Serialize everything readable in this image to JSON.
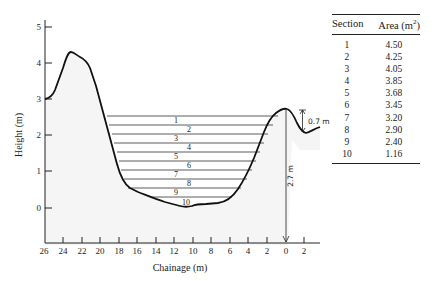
{
  "figure": {
    "y_axis": {
      "label": "Height (m)",
      "ticks": [
        "0",
        "1",
        "2",
        "3",
        "4",
        "5"
      ]
    },
    "x_axis": {
      "label": "Chainage (m)",
      "ticks": [
        "26",
        "24",
        "22",
        "20",
        "18",
        "16",
        "14",
        "12",
        "10",
        "8",
        "6",
        "4",
        "2",
        "0",
        "2"
      ]
    },
    "section_labels": [
      "1",
      "2",
      "3",
      "4",
      "5",
      "6",
      "7",
      "8",
      "9",
      "10"
    ],
    "annotations": {
      "vertical_depth": "2.7 m",
      "bank_drop": "0.7 m"
    }
  },
  "table": {
    "headers": {
      "section": "Section",
      "area": "Area (m",
      "area_sup": "2",
      "area_close": ")"
    },
    "rows": [
      {
        "section": "1",
        "area": "4.50"
      },
      {
        "section": "2",
        "area": "4.25"
      },
      {
        "section": "3",
        "area": "4.05"
      },
      {
        "section": "4",
        "area": "3.85"
      },
      {
        "section": "5",
        "area": "3.68"
      },
      {
        "section": "6",
        "area": "3.45"
      },
      {
        "section": "7",
        "area": "3.20"
      },
      {
        "section": "8",
        "area": "2.90"
      },
      {
        "section": "9",
        "area": "2.40"
      },
      {
        "section": "10",
        "area": "1.16"
      }
    ]
  }
}
